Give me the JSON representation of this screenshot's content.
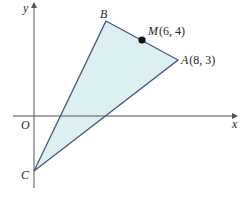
{
  "diagram": {
    "axes": {
      "x_label": "x",
      "y_label": "y",
      "origin_label": "O"
    },
    "points": {
      "A": {
        "name": "A",
        "coords": "(8, 3)"
      },
      "B": {
        "name": "B",
        "coords": ""
      },
      "C": {
        "name": "C",
        "coords": ""
      },
      "M": {
        "name": "M",
        "coords": "(6, 4)"
      }
    },
    "colors": {
      "fill": "#dcf0f2",
      "stroke": "#4a5680",
      "axis": "#555555",
      "point": "#111111"
    }
  }
}
